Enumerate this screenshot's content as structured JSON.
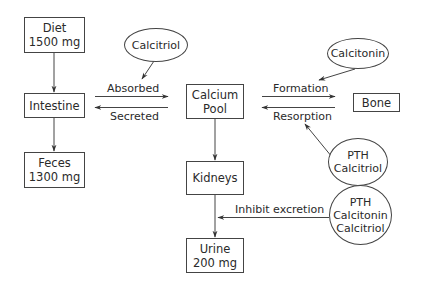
{
  "diagram": {
    "nodes": {
      "diet": {
        "line1": "Diet",
        "line2": "1500 mg"
      },
      "intestine": {
        "line1": "Intestine"
      },
      "feces": {
        "line1": "Feces",
        "line2": "1300 mg"
      },
      "calcium_pool": {
        "line1": "Calcium",
        "line2": "Pool"
      },
      "kidneys": {
        "line1": "Kidneys"
      },
      "urine": {
        "line1": "Urine",
        "line2": "200 mg"
      },
      "bone": {
        "line1": "Bone"
      }
    },
    "regulators": {
      "calcitriol": {
        "line1": "Calcitriol"
      },
      "calcitonin": {
        "line1": "Calcitonin"
      },
      "pth_calcitriol": {
        "line1": "PTH",
        "line2": "Calcitriol"
      },
      "pth_calcitonin_calcitriol": {
        "line1": "PTH",
        "line2": "Calcitonin",
        "line3": "Calcitriol"
      }
    },
    "edges": {
      "absorbed": "Absorbed",
      "secreted": "Secreted",
      "formation": "Formation",
      "resorption": "Resorption",
      "inhibit_excretion": "Inhibit excretion"
    },
    "colors": {
      "line": "#444444",
      "text": "#2a2a2a",
      "background": "#ffffff"
    }
  }
}
